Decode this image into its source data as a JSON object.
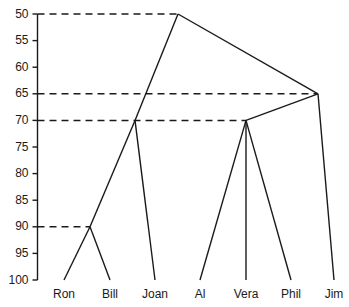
{
  "chart_data": {
    "type": "dendrogram",
    "title": "",
    "xlabel": "",
    "ylabel": "",
    "ylim": [
      50,
      100
    ],
    "y_inverted": true,
    "grid": false,
    "legend": null,
    "axis_ticks": [
      {
        "value": 50,
        "label": "50",
        "guide": true
      },
      {
        "value": 55,
        "label": "55",
        "guide": false
      },
      {
        "value": 60,
        "label": "60",
        "guide": false
      },
      {
        "value": 65,
        "label": "65",
        "guide": true
      },
      {
        "value": 70,
        "label": "70",
        "guide": true
      },
      {
        "value": 75,
        "label": "75",
        "guide": false
      },
      {
        "value": 80,
        "label": "80",
        "guide": false
      },
      {
        "value": 85,
        "label": "85",
        "guide": false
      },
      {
        "value": 90,
        "label": "90",
        "guide": true
      },
      {
        "value": 95,
        "label": "95",
        "guide": false
      },
      {
        "value": 100,
        "label": "100",
        "guide": false
      }
    ],
    "leaves": [
      {
        "name": "Ron",
        "x": 64,
        "y": 100
      },
      {
        "name": "Bill",
        "x": 110,
        "y": 100
      },
      {
        "name": "Joan",
        "x": 155,
        "y": 100
      },
      {
        "name": "Al",
        "x": 200,
        "y": 100
      },
      {
        "name": "Vera",
        "x": 246,
        "y": 100
      },
      {
        "name": "Phil",
        "x": 291,
        "y": 100
      },
      {
        "name": "Jim",
        "x": 334,
        "y": 100
      }
    ],
    "nodes": [
      {
        "id": "n_ron_bill",
        "x": 90,
        "y": 90,
        "label": "90",
        "children": [
          "Ron",
          "Bill"
        ]
      },
      {
        "id": "n_ronbill_joan",
        "x": 135,
        "y": 70,
        "label": "70",
        "children": [
          "n_ron_bill",
          "Joan"
        ]
      },
      {
        "id": "n_al_vera_phil",
        "x": 246,
        "y": 70,
        "label": "70",
        "children": [
          "Al",
          "Vera",
          "Phil"
        ]
      },
      {
        "id": "n_right_jim",
        "x": 318,
        "y": 65,
        "label": "65",
        "children": [
          "n_al_vera_phil",
          "Jim"
        ]
      },
      {
        "id": "n_root",
        "x": 178,
        "y": 50,
        "label": "50",
        "children": [
          "n_ronbill_joan",
          "n_right_jim"
        ]
      }
    ],
    "edges": [
      {
        "from": {
          "x": 90,
          "y": 90
        },
        "to": {
          "x": 64,
          "y": 100
        }
      },
      {
        "from": {
          "x": 90,
          "y": 90
        },
        "to": {
          "x": 110,
          "y": 100
        }
      },
      {
        "from": {
          "x": 135,
          "y": 70
        },
        "to": {
          "x": 90,
          "y": 90
        }
      },
      {
        "from": {
          "x": 135,
          "y": 70
        },
        "to": {
          "x": 155,
          "y": 100
        }
      },
      {
        "from": {
          "x": 246,
          "y": 70
        },
        "to": {
          "x": 200,
          "y": 100
        }
      },
      {
        "from": {
          "x": 246,
          "y": 70
        },
        "to": {
          "x": 246,
          "y": 100
        }
      },
      {
        "from": {
          "x": 246,
          "y": 70
        },
        "to": {
          "x": 291,
          "y": 100
        }
      },
      {
        "from": {
          "x": 318,
          "y": 65
        },
        "to": {
          "x": 246,
          "y": 70
        }
      },
      {
        "from": {
          "x": 318,
          "y": 65
        },
        "to": {
          "x": 334,
          "y": 100
        }
      },
      {
        "from": {
          "x": 178,
          "y": 50
        },
        "to": {
          "x": 135,
          "y": 70
        }
      },
      {
        "from": {
          "x": 178,
          "y": 50
        },
        "to": {
          "x": 318,
          "y": 65
        }
      }
    ],
    "guide_lines": [
      {
        "value": 50,
        "to_x": 178
      },
      {
        "value": 65,
        "to_x": 318
      },
      {
        "value": 70,
        "to_x": 246
      },
      {
        "value": 90,
        "to_x": 90
      }
    ]
  }
}
